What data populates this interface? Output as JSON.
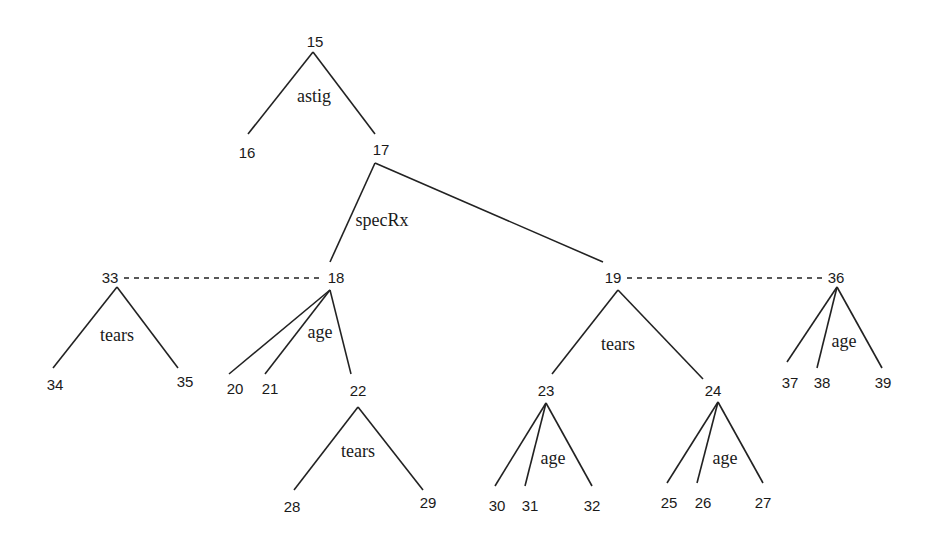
{
  "diagram": {
    "type": "tree",
    "nodes": [
      {
        "id": "15",
        "x": 315,
        "y": 47
      },
      {
        "id": "16",
        "x": 247,
        "y": 158
      },
      {
        "id": "17",
        "x": 381,
        "y": 155
      },
      {
        "id": "18",
        "x": 336,
        "y": 283
      },
      {
        "id": "19",
        "x": 613,
        "y": 283
      },
      {
        "id": "33",
        "x": 110,
        "y": 283
      },
      {
        "id": "36",
        "x": 836,
        "y": 283
      },
      {
        "id": "34",
        "x": 55,
        "y": 390
      },
      {
        "id": "35",
        "x": 185,
        "y": 387
      },
      {
        "id": "20",
        "x": 235,
        "y": 394
      },
      {
        "id": "21",
        "x": 270,
        "y": 394
      },
      {
        "id": "22",
        "x": 358,
        "y": 396
      },
      {
        "id": "23",
        "x": 546,
        "y": 396
      },
      {
        "id": "24",
        "x": 713,
        "y": 396
      },
      {
        "id": "37",
        "x": 790,
        "y": 388
      },
      {
        "id": "38",
        "x": 822,
        "y": 388
      },
      {
        "id": "39",
        "x": 883,
        "y": 388
      },
      {
        "id": "28",
        "x": 292,
        "y": 512
      },
      {
        "id": "29",
        "x": 428,
        "y": 508
      },
      {
        "id": "30",
        "x": 497,
        "y": 511
      },
      {
        "id": "31",
        "x": 530,
        "y": 511
      },
      {
        "id": "32",
        "x": 592,
        "y": 511
      },
      {
        "id": "25",
        "x": 669,
        "y": 508
      },
      {
        "id": "26",
        "x": 703,
        "y": 508
      },
      {
        "id": "27",
        "x": 763,
        "y": 508
      }
    ],
    "edges": [
      {
        "x1": 313,
        "y1": 52,
        "x2": 248,
        "y2": 134
      },
      {
        "x1": 313,
        "y1": 52,
        "x2": 375,
        "y2": 134
      },
      {
        "x1": 375,
        "y1": 163,
        "x2": 330,
        "y2": 262
      },
      {
        "x1": 375,
        "y1": 163,
        "x2": 603,
        "y2": 262
      },
      {
        "x1": 117,
        "y1": 287,
        "x2": 53,
        "y2": 368
      },
      {
        "x1": 117,
        "y1": 287,
        "x2": 178,
        "y2": 368
      },
      {
        "x1": 330,
        "y1": 290,
        "x2": 229,
        "y2": 374
      },
      {
        "x1": 330,
        "y1": 290,
        "x2": 265,
        "y2": 374
      },
      {
        "x1": 330,
        "y1": 290,
        "x2": 351,
        "y2": 374
      },
      {
        "x1": 618,
        "y1": 290,
        "x2": 552,
        "y2": 374
      },
      {
        "x1": 618,
        "y1": 290,
        "x2": 703,
        "y2": 379
      },
      {
        "x1": 837,
        "y1": 287,
        "x2": 787,
        "y2": 362
      },
      {
        "x1": 837,
        "y1": 287,
        "x2": 817,
        "y2": 368
      },
      {
        "x1": 837,
        "y1": 287,
        "x2": 882,
        "y2": 368
      },
      {
        "x1": 358,
        "y1": 407,
        "x2": 294,
        "y2": 490
      },
      {
        "x1": 358,
        "y1": 407,
        "x2": 423,
        "y2": 490
      },
      {
        "x1": 546,
        "y1": 403,
        "x2": 495,
        "y2": 486
      },
      {
        "x1": 546,
        "y1": 403,
        "x2": 525,
        "y2": 486
      },
      {
        "x1": 546,
        "y1": 403,
        "x2": 592,
        "y2": 486
      },
      {
        "x1": 718,
        "y1": 402,
        "x2": 667,
        "y2": 483
      },
      {
        "x1": 718,
        "y1": 402,
        "x2": 697,
        "y2": 483
      },
      {
        "x1": 718,
        "y1": 402,
        "x2": 763,
        "y2": 483
      }
    ],
    "dashed_edges": [
      {
        "x1": 124,
        "y1": 278,
        "x2": 320,
        "y2": 278
      },
      {
        "x1": 627,
        "y1": 278,
        "x2": 822,
        "y2": 278
      }
    ],
    "labels": [
      {
        "text": "astig",
        "x": 314,
        "y": 102
      },
      {
        "text": "specRx",
        "x": 382,
        "y": 226
      },
      {
        "text": "tears",
        "x": 117,
        "y": 341
      },
      {
        "text": "age",
        "x": 320,
        "y": 338
      },
      {
        "text": "tears",
        "x": 618,
        "y": 350
      },
      {
        "text": "age",
        "x": 844,
        "y": 347
      },
      {
        "text": "tears",
        "x": 358,
        "y": 457
      },
      {
        "text": "age",
        "x": 553,
        "y": 464
      },
      {
        "text": "age",
        "x": 725,
        "y": 464
      }
    ]
  }
}
